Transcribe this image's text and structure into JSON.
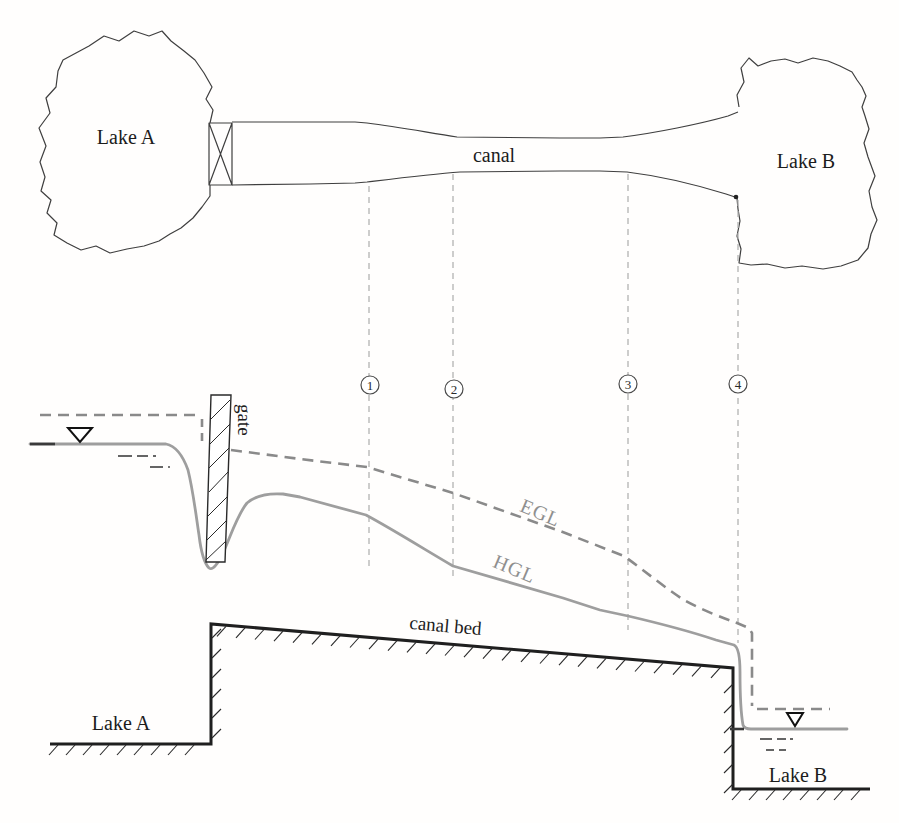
{
  "figure_title": "canal connecting two lakes - plan and profile with EGL and HGL",
  "colors": {
    "ink": "#1c1c1c",
    "plan_outline": "#3f3f3f",
    "egl_gray": "#8a8a8a",
    "hgl_gray": "#9e9e9e",
    "station_dash_gray": "#b3b3b3",
    "grade_label_gray": "#8f8f8f",
    "background": "#fffefd"
  },
  "icons": {
    "water_surface_marker": "▽",
    "gate_plan_symbol": "box-with-X",
    "gate_profile_symbol": "hatched-bar",
    "ground_hatch": "diagonal-ticks"
  },
  "plan": {
    "lake_a": "Lake A",
    "canal": "canal",
    "lake_b": "Lake B"
  },
  "stations": [
    {
      "label": "1"
    },
    {
      "label": "2"
    },
    {
      "label": "3"
    },
    {
      "label": "4"
    }
  ],
  "profile": {
    "gate": "gate",
    "egl": "EGL",
    "hgl": "HGL",
    "canal_bed": "canal bed",
    "lake_a": "Lake A",
    "lake_b": "Lake B"
  }
}
